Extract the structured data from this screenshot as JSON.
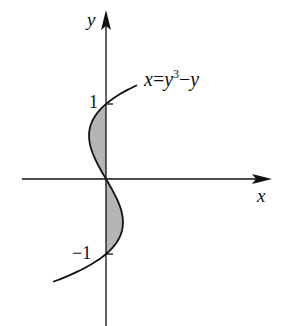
{
  "diagram": {
    "type": "function-graph",
    "axis_labels": {
      "x": "x",
      "y": "y"
    },
    "tick_labels": {
      "top": "1",
      "bottom": "−1"
    },
    "equation": {
      "lhs": "x",
      "eq": "=",
      "y": "y",
      "exp": "3",
      "minus": "−",
      "y2": "y"
    },
    "shaded_regions": [
      "between curve and y-axis for 0 ≤ y ≤ 1",
      "between curve and y-axis for −1 ≤ y ≤ 0"
    ],
    "colors": {
      "stroke": "#111111",
      "fill": "#b5b5b5"
    }
  }
}
